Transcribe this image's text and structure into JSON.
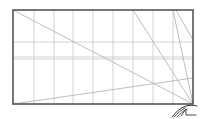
{
  "diagram": {
    "type": "perspective-construction-sketch",
    "canvas": {
      "width": 202,
      "height": 119,
      "background": "#ffffff"
    },
    "frame": {
      "x1": 13,
      "y1": 10,
      "x2": 193,
      "y2": 104,
      "stroke": "#555555",
      "stroke_width": 1.6
    },
    "grid": {
      "stroke": "#c8c8c8",
      "vertical_x": [
        34,
        54,
        73,
        93,
        113,
        133,
        153,
        173
      ],
      "horizontal_y": [
        42,
        57,
        59
      ]
    },
    "construction_lines": [
      {
        "x1": 13,
        "y1": 10,
        "x2": 193,
        "y2": 104
      },
      {
        "x1": 13,
        "y1": 104,
        "x2": 193,
        "y2": 78
      },
      {
        "x1": 133,
        "y1": 10,
        "x2": 193,
        "y2": 104
      },
      {
        "x1": 173,
        "y1": 10,
        "x2": 193,
        "y2": 104
      },
      {
        "x1": 176,
        "y1": 10,
        "x2": 193,
        "y2": 40
      }
    ],
    "construction_stroke": "#b5b5b5",
    "signature": {
      "x": 184,
      "y": 111,
      "stroke": "#333333"
    }
  }
}
